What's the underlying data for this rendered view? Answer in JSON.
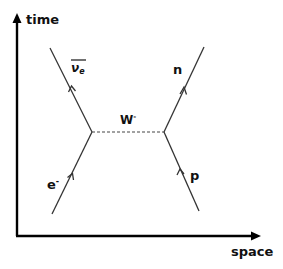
{
  "diagram": {
    "type": "feynman",
    "axes": {
      "y_label": "time",
      "x_label": "space"
    },
    "particles": {
      "electron": {
        "label": "e",
        "superscript": "-"
      },
      "antineutrino": {
        "label": "ν",
        "subscript": "e",
        "overbar": true
      },
      "boson": {
        "label": "W",
        "superscript": "-"
      },
      "proton": {
        "label": "p"
      },
      "neutron": {
        "label": "n"
      }
    },
    "colors": {
      "axis": "#000000",
      "line": "#333333",
      "text": "#111111"
    }
  }
}
